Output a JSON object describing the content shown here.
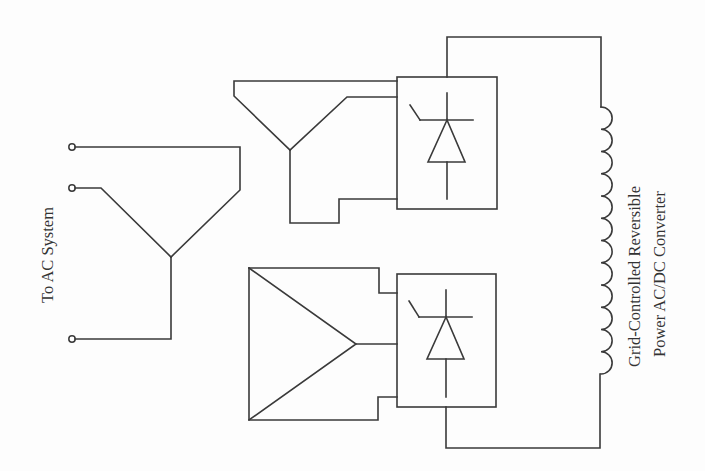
{
  "diagram": {
    "labels": {
      "ac_system": "To AC System",
      "converter_line1": "Grid-Controlled Reversible",
      "converter_line2": "Power AC/DC Converter"
    },
    "components": [
      {
        "id": "ac-terminals",
        "type": "terminal",
        "count": 3
      },
      {
        "id": "transformer-primary",
        "type": "wye-winding"
      },
      {
        "id": "transformer-secondary-upper",
        "type": "wye-winding"
      },
      {
        "id": "transformer-secondary-lower",
        "type": "delta-winding"
      },
      {
        "id": "thyristor-bridge-upper",
        "type": "thyristor-bridge"
      },
      {
        "id": "thyristor-bridge-lower",
        "type": "thyristor-bridge"
      },
      {
        "id": "dc-smoothing-reactor",
        "type": "inductor",
        "turns": 12
      }
    ],
    "colors": {
      "line": "#3a3a3a",
      "text": "#333333",
      "background": "#fdfdfd"
    }
  }
}
